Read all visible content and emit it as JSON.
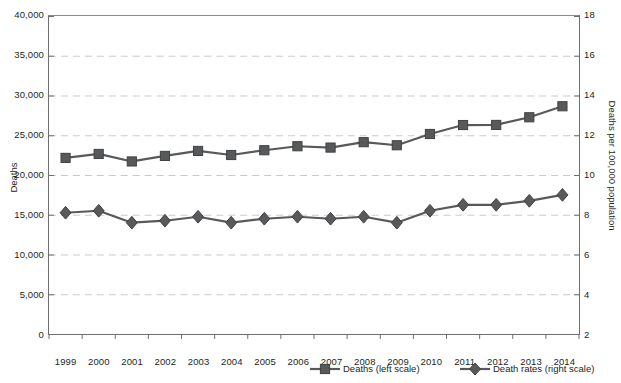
{
  "chart_data": {
    "type": "line",
    "title": "",
    "subtitle": "",
    "xlabel": "",
    "ylabel": "Deaths",
    "y2label": "Deaths per 100,000 population",
    "grid": true,
    "legend_position": "bottom-right",
    "x": [
      1999,
      2000,
      2001,
      2002,
      2003,
      2004,
      2005,
      2006,
      2007,
      2008,
      2009,
      2010,
      2011,
      2012,
      2013,
      2014
    ],
    "categories": [
      "1999",
      "2000",
      "2001",
      "2002",
      "2003",
      "2004",
      "2005",
      "2006",
      "2007",
      "2008",
      "2009",
      "2010",
      "2011",
      "2012",
      "2013",
      "2014"
    ],
    "ylim": [
      0,
      40000
    ],
    "yticks": [
      0,
      5000,
      10000,
      15000,
      20000,
      25000,
      30000,
      35000,
      40000
    ],
    "ytick_labels": [
      "0",
      "5,000",
      "10,000",
      "15,000",
      "20,000",
      "25,000",
      "30,000",
      "35,000",
      "40,000"
    ],
    "y2lim": [
      2,
      18
    ],
    "y2ticks": [
      2,
      4,
      6,
      8,
      10,
      12,
      14,
      16,
      18
    ],
    "y2tick_labels": [
      "2",
      "4",
      "6",
      "8",
      "10",
      "12",
      "14",
      "16",
      "18"
    ],
    "series": [
      {
        "name": "Deaths (left scale)",
        "axis": "left",
        "marker": "square",
        "color": "#58595b",
        "values": [
          22153,
          22650,
          21705,
          22401,
          23027,
          22515,
          23115,
          23618,
          23450,
          24129,
          23742,
          25161,
          26284,
          26299,
          27260,
          28647
        ]
      },
      {
        "name": "Death rates (right scale)",
        "axis": "right",
        "marker": "diamond",
        "color": "#58595b",
        "values": [
          8.1,
          8.2,
          7.6,
          7.7,
          7.9,
          7.6,
          7.8,
          7.9,
          7.8,
          7.9,
          7.6,
          8.2,
          8.5,
          8.5,
          8.7,
          9.0
        ]
      }
    ]
  },
  "axes": {
    "left_title": "Deaths",
    "right_title": "Deaths per 100,000 population"
  },
  "legend": {
    "items": [
      {
        "label": "Deaths (left scale)",
        "marker": "square",
        "color": "#58595b"
      },
      {
        "label": "Death rates (right scale)",
        "marker": "diamond",
        "color": "#58595b"
      }
    ]
  },
  "colors": {
    "series": "#58595b",
    "grid": "#c9cacc",
    "axis": "#6d6e71",
    "text": "#231f20",
    "background": "#ffffff"
  }
}
